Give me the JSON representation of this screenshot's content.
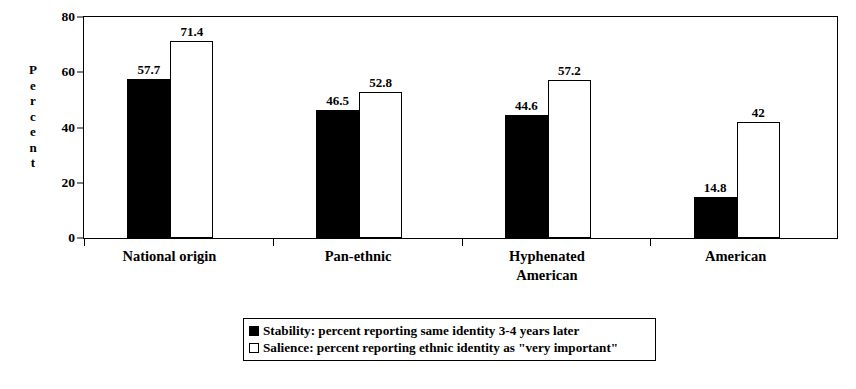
{
  "chart_data": {
    "type": "bar",
    "title": "",
    "xlabel": "",
    "ylabel": "Percent",
    "ylim": [
      0,
      80
    ],
    "yticks": [
      0,
      20,
      40,
      60,
      80
    ],
    "grid": false,
    "legend_position": "bottom",
    "categories": [
      "National origin",
      "Pan-ethnic",
      "Hyphenated\nAmerican",
      "American"
    ],
    "series": [
      {
        "name": "Stability: percent reporting same identity 3-4 years later",
        "short_name": "Stability",
        "color": "#000000",
        "swatch": "filled",
        "values": [
          57.7,
          46.5,
          44.6,
          14.8
        ],
        "labels": [
          "57.7",
          "46.5",
          "44.6",
          "14.8"
        ]
      },
      {
        "name": "Salience: percent reporting ethnic identity as \"very important\"",
        "short_name": "Salience",
        "color": "#ffffff",
        "swatch": "hollow",
        "values": [
          71.4,
          52.8,
          57.2,
          42
        ],
        "labels": [
          "71.4",
          "52.8",
          "57.2",
          "42"
        ]
      }
    ]
  },
  "axis": {
    "y_title_letters": [
      "P",
      "e",
      "r",
      "c",
      "e",
      "n",
      "t"
    ],
    "y_tick_labels": [
      "80",
      "60",
      "40",
      "20",
      "0"
    ]
  },
  "legend": {
    "items": [
      {
        "swatch": "filled",
        "label": "Stability: percent reporting same identity 3-4 years later"
      },
      {
        "swatch": "hollow",
        "label": "Salience: percent reporting ethnic identity as \"very important\""
      }
    ]
  }
}
